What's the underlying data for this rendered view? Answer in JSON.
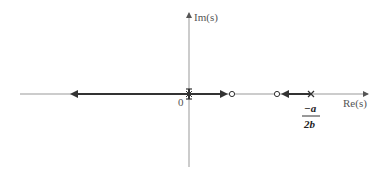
{
  "diagram": {
    "axes": {
      "x_label": "Re(s)",
      "y_label": "Im(s)",
      "origin_label": "0"
    },
    "markers": {
      "origin": "double pole at origin",
      "zero_1": "zero (open circle) right of origin",
      "zero_2": "zero (open circle) left of pole",
      "pole": "pole (x) at -a/2b"
    },
    "pole_label": {
      "numerator": "−a",
      "denominator": "2b"
    },
    "colors": {
      "axis": "#888888",
      "locus": "#333333"
    }
  }
}
